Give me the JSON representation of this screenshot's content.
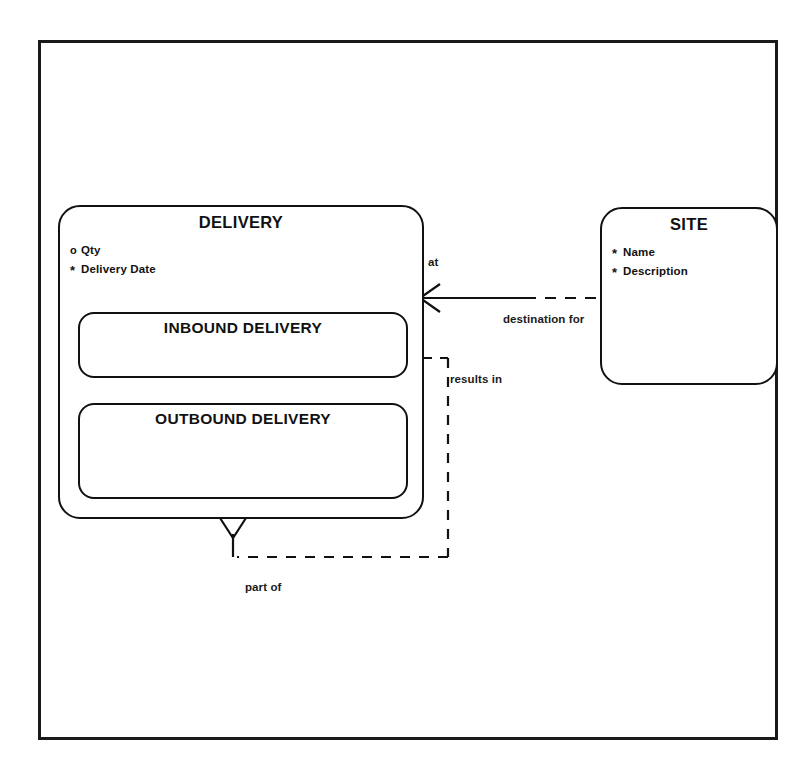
{
  "diagram": {
    "type": "entity-relationship-diagram",
    "notation": "barker",
    "title": "",
    "frame": {
      "border_color": "#1a1a1a",
      "background": "#ffffff"
    },
    "entities": [
      {
        "id": "delivery",
        "name": "DELIVERY",
        "attributes": [
          {
            "marker": "o",
            "optionality": "optional",
            "name": "Qty"
          },
          {
            "marker": "*",
            "optionality": "mandatory",
            "name": "Delivery Date"
          }
        ],
        "subtypes": [
          {
            "id": "inbound-delivery",
            "name": "INBOUND DELIVERY",
            "attributes": []
          },
          {
            "id": "outbound-delivery",
            "name": "OUTBOUND DELIVERY",
            "attributes": []
          }
        ]
      },
      {
        "id": "site",
        "name": "SITE",
        "attributes": [
          {
            "marker": "*",
            "optionality": "mandatory",
            "name": "Name"
          },
          {
            "marker": "*",
            "optionality": "mandatory",
            "name": "Description"
          }
        ],
        "subtypes": []
      }
    ],
    "relationships": [
      {
        "id": "delivery-site",
        "from": "delivery",
        "to": "site",
        "from_label": "at",
        "to_label": "destination for",
        "from_end": {
          "cardinality": "many",
          "optionality": "mandatory",
          "marker": "crows-foot"
        },
        "to_end": {
          "cardinality": "one",
          "optionality": "optional",
          "marker": "single"
        }
      },
      {
        "id": "delivery-results-in",
        "from": "delivery",
        "to": "delivery",
        "from_label": "results in",
        "to_label": "part of",
        "from_end": {
          "cardinality": "one",
          "optionality": "optional",
          "marker": "single"
        },
        "to_end": {
          "cardinality": "many",
          "optionality": "mandatory",
          "marker": "crows-foot"
        }
      }
    ]
  },
  "labels": {
    "at": "at",
    "destination_for": "destination for",
    "results_in": "results in",
    "part_of": "part of"
  }
}
